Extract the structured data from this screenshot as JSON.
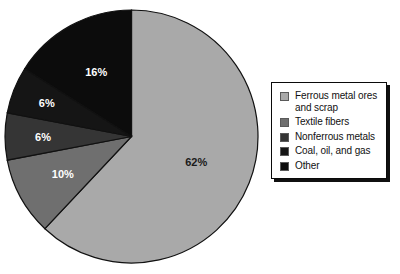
{
  "chart_data": {
    "type": "pie",
    "title": "",
    "subtitle": "",
    "xlabel": "",
    "ylabel": "",
    "legend_position": "right",
    "grid": false,
    "categories": [
      "Ferrous metal ores and scrap",
      "Textile fibers",
      "Nonferrous metals",
      "Coal, oil, and gas",
      "Other"
    ],
    "values": [
      62,
      10,
      6,
      6,
      16
    ],
    "data_labels": [
      "62%",
      "10%",
      "6%",
      "6%",
      "16%"
    ],
    "colors": [
      "#a9a9a9",
      "#6f6f6f",
      "#353535",
      "#151515",
      "#0c0c0c"
    ],
    "label_text_colors": [
      "#1a1a1a",
      "#ffffff",
      "#ffffff",
      "#ffffff",
      "#ffffff"
    ],
    "start_angle_deg": 0,
    "direction": "clockwise",
    "slices": [
      {
        "label": "Ferrous metal ores and scrap",
        "value": 62,
        "display": "62%",
        "color": "#a9a9a9",
        "swatch": "#a9a9a9"
      },
      {
        "label": "Textile fibers",
        "value": 10,
        "display": "10%",
        "color": "#6f6f6f",
        "swatch": "#6f6f6f"
      },
      {
        "label": "Nonferrous metals",
        "value": 6,
        "display": "6%",
        "color": "#353535",
        "swatch": "#353535"
      },
      {
        "label": "Coal, oil, and gas",
        "value": 6,
        "display": "6%",
        "color": "#151515",
        "swatch": "#151515"
      },
      {
        "label": "Other",
        "value": 16,
        "display": "16%",
        "color": "#0c0c0c",
        "swatch": "#0c0c0c"
      }
    ]
  },
  "legend": {
    "items": [
      {
        "label": "Ferrous metal ores and scrap",
        "color": "#a9a9a9"
      },
      {
        "label": "Textile fibers",
        "color": "#6f6f6f"
      },
      {
        "label": "Nonferrous metals",
        "color": "#353535"
      },
      {
        "label": "Coal, oil, and gas",
        "color": "#151515"
      },
      {
        "label": "Other",
        "color": "#0c0c0c"
      }
    ]
  },
  "style": {
    "background": "#ffffff",
    "pie_outline": "#111111",
    "legend_border": "#0a0a0a",
    "legend_background": "#ffffff"
  }
}
